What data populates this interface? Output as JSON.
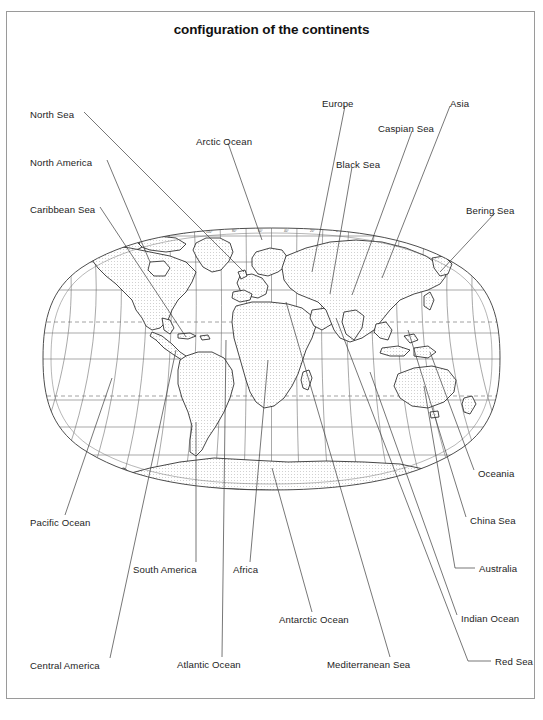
{
  "figure": {
    "title": "configuration of the continents",
    "map_type": "world-map-oval-projection",
    "border_color": "#9a9a9a",
    "ink_color": "#1a1a1a"
  },
  "map": {
    "projection": "oval (Robinson-like) whole-world projection",
    "graticule": {
      "parallels_deg": [
        80,
        60,
        40,
        23.5,
        20,
        0,
        -20,
        -23.5,
        -40,
        -60,
        -80
      ],
      "meridians_deg": [
        -180,
        -160,
        -140,
        -120,
        -100,
        -80,
        -60,
        -40,
        -20,
        0,
        20,
        40,
        60,
        80,
        100,
        120,
        140,
        160,
        180
      ],
      "dashed_parallels_deg": [
        23.5,
        -23.5
      ],
      "tick_labels_top": [
        "160°",
        "140°",
        "120°",
        "100°",
        "80°",
        "60°",
        "40°",
        "20°",
        "0°",
        "20°",
        "40°",
        "60°",
        "80°",
        "100°",
        "120°",
        "140°",
        "160°"
      ],
      "tick_labels_bottom": [
        "160°",
        "140°",
        "120°",
        "100°",
        "80°",
        "60°",
        "40°",
        "20°",
        "0°",
        "20°",
        "40°",
        "60°",
        "80°",
        "100°",
        "120°",
        "140°",
        "160°"
      ]
    },
    "landmasses": [
      "North America",
      "South America",
      "Eurasia",
      "Africa",
      "Australia",
      "Antarctica",
      "Greenland",
      "Madagascar",
      "New Zealand",
      "Indonesia",
      "Japan",
      "British Isles"
    ]
  },
  "labels": [
    {
      "id": "north-sea",
      "text": "North Sea",
      "side": "left"
    },
    {
      "id": "north-america",
      "text": "North America",
      "side": "left"
    },
    {
      "id": "caribbean-sea",
      "text": "Caribbean Sea",
      "side": "left"
    },
    {
      "id": "pacific-ocean",
      "text": "Pacific Ocean",
      "side": "left"
    },
    {
      "id": "central-america",
      "text": "Central America",
      "side": "left"
    },
    {
      "id": "arctic-ocean",
      "text": "Arctic Ocean",
      "side": "top"
    },
    {
      "id": "europe",
      "text": "Europe",
      "side": "top"
    },
    {
      "id": "black-sea",
      "text": "Black Sea",
      "side": "top"
    },
    {
      "id": "caspian-sea",
      "text": "Caspian Sea",
      "side": "top"
    },
    {
      "id": "asia",
      "text": "Asia",
      "side": "top"
    },
    {
      "id": "bering-sea",
      "text": "Bering Sea",
      "side": "right"
    },
    {
      "id": "oceania",
      "text": "Oceania",
      "side": "right"
    },
    {
      "id": "china-sea",
      "text": "China Sea",
      "side": "right"
    },
    {
      "id": "australia",
      "text": "Australia",
      "side": "right"
    },
    {
      "id": "indian-ocean",
      "text": "Indian Ocean",
      "side": "right"
    },
    {
      "id": "red-sea",
      "text": "Red Sea",
      "side": "right"
    },
    {
      "id": "south-america",
      "text": "South America",
      "side": "bottom"
    },
    {
      "id": "africa",
      "text": "Africa",
      "side": "bottom"
    },
    {
      "id": "antarctic-ocean",
      "text": "Antarctic Ocean",
      "side": "bottom"
    },
    {
      "id": "atlantic-ocean",
      "text": "Atlantic Ocean",
      "side": "bottom"
    },
    {
      "id": "mediterranean-sea",
      "text": "Mediterranean Sea",
      "side": "bottom"
    }
  ]
}
